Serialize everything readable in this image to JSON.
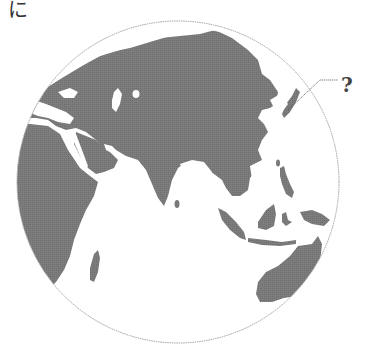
{
  "figure": {
    "corner_label": "に",
    "callout_label": "?",
    "projection": "orthographic globe centered on Asia",
    "colors": {
      "land": "#7a7a7a",
      "ocean": "#ffffff",
      "globe_outline": "#9a9a9a",
      "callout_line": "#555555",
      "label_text": "#444444"
    },
    "regions_shown": [
      "Europe",
      "Africa",
      "Middle East",
      "Russia",
      "Central Asia",
      "India",
      "China",
      "Southeast Asia",
      "Indonesia",
      "Australia",
      "Madagascar",
      "Japan"
    ],
    "callout_target": "Japan / Korean peninsula region"
  }
}
